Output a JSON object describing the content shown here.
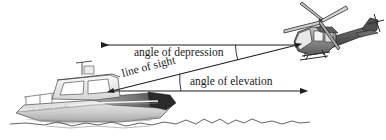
{
  "figure": {
    "background_color": "#ffffff",
    "width": 386,
    "height": 140
  },
  "labels": {
    "angle_of_depression": "angle of depression",
    "angle_of_elevation": "angle of elevation",
    "line_of_sight": "line of sight"
  },
  "objects": {
    "helicopter": {
      "name": "helicopter",
      "position": "upper-right",
      "body_color": "#7a7a7a",
      "outline_color": "#2b2b2b"
    },
    "boat": {
      "name": "boat",
      "position": "lower-left",
      "hull_text": "U.S. COAST GUARD",
      "hull_color": "#c9c9c9",
      "outline_color": "#3a3a3a"
    },
    "water": {
      "name": "water-surface",
      "color": "#4a4a4a"
    }
  },
  "geometry": {
    "observer_point": {
      "x": 113,
      "y": 91
    },
    "target_point": {
      "x": 297,
      "y": 45
    },
    "depression_horizontal": {
      "from": {
        "x": 297,
        "y": 45
      },
      "to": {
        "x": 99,
        "y": 45
      },
      "arrow": "left"
    },
    "elevation_horizontal": {
      "from": {
        "x": 113,
        "y": 91
      },
      "to": {
        "x": 302,
        "y": 91
      },
      "arrow": "right"
    },
    "line_of_sight": {
      "from": {
        "x": 113,
        "y": 91
      },
      "to": {
        "x": 297,
        "y": 45
      },
      "arrow": "both"
    },
    "depression_arc": {
      "cx": 297,
      "cy": 45,
      "radius": 62
    },
    "elevation_arc": {
      "cx": 113,
      "cy": 91,
      "radius": 68
    }
  },
  "colors": {
    "line": "#1f1f1f",
    "text": "#1a1a1a",
    "water": "#4a4a4a",
    "helicopter_fill": "#8a8a8a",
    "boat_fill": "#d0d0d0"
  }
}
